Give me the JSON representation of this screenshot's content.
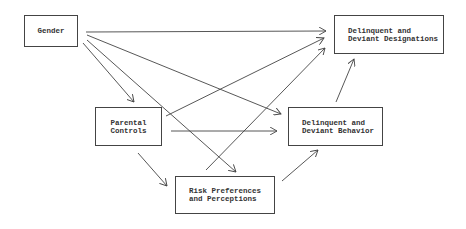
{
  "nodes": {
    "gender": {
      "lines": [
        "Gender"
      ]
    },
    "designations": {
      "lines": [
        "Delinquent and",
        "Deviant Designations"
      ]
    },
    "parental": {
      "lines": [
        "Parental",
        "Controls"
      ]
    },
    "behavior": {
      "lines": [
        "Delinquent and",
        "Deviant Behavior"
      ]
    },
    "risk": {
      "lines": [
        "Risk Preferences",
        "and Perceptions"
      ]
    }
  },
  "edges": [
    {
      "from": "Gender",
      "to": "Delinquent and Deviant Designations"
    },
    {
      "from": "Gender",
      "to": "Parental Controls"
    },
    {
      "from": "Gender",
      "to": "Delinquent and Deviant Behavior"
    },
    {
      "from": "Gender",
      "to": "Risk Preferences and Perceptions"
    },
    {
      "from": "Parental Controls",
      "to": "Delinquent and Deviant Designations"
    },
    {
      "from": "Parental Controls",
      "to": "Delinquent and Deviant Behavior"
    },
    {
      "from": "Parental Controls",
      "to": "Risk Preferences and Perceptions"
    },
    {
      "from": "Risk Preferences and Perceptions",
      "to": "Delinquent and Deviant Designations"
    },
    {
      "from": "Risk Preferences and Perceptions",
      "to": "Delinquent and Deviant Behavior"
    },
    {
      "from": "Delinquent and Deviant Behavior",
      "to": "Delinquent and Deviant Designations"
    }
  ]
}
